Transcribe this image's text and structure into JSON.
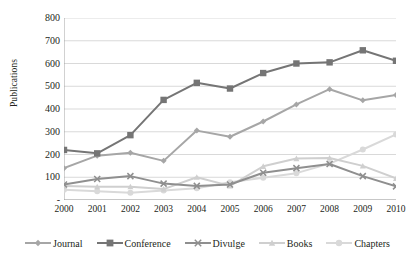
{
  "chart_data": {
    "type": "line",
    "title": "",
    "xlabel": "",
    "ylabel": "Publications",
    "x": [
      2000,
      2001,
      2002,
      2003,
      2004,
      2005,
      2006,
      2007,
      2008,
      2009,
      2010
    ],
    "categories": [
      "2000",
      "2001",
      "2002",
      "2003",
      "2004",
      "2005",
      "2006",
      "2007",
      "2008",
      "2009",
      "2010"
    ],
    "xlim": [
      2000,
      2010
    ],
    "ylim": [
      0,
      800
    ],
    "yticks": [
      0,
      100,
      200,
      300,
      400,
      500,
      600,
      700,
      800
    ],
    "ytick_labels": [
      "-",
      "100",
      "200",
      "300",
      "400",
      "500",
      "600",
      "700",
      "800"
    ],
    "grid": "horizontal",
    "legend_position": "bottom",
    "series": [
      {
        "name": "Journal",
        "marker": "diamond",
        "color": "#a6a6a6",
        "values": [
          140,
          195,
          208,
          172,
          305,
          278,
          345,
          420,
          487,
          438,
          462
        ]
      },
      {
        "name": "Conference",
        "marker": "square",
        "color": "#757575",
        "values": [
          220,
          205,
          285,
          440,
          515,
          490,
          558,
          600,
          605,
          658,
          612
        ]
      },
      {
        "name": "Divulge",
        "marker": "x",
        "color": "#8f8f8f",
        "values": [
          68,
          92,
          105,
          72,
          62,
          68,
          120,
          140,
          158,
          105,
          60
        ]
      },
      {
        "name": "Books",
        "marker": "triangle",
        "color": "#cfcfcf",
        "values": [
          62,
          58,
          58,
          48,
          100,
          62,
          148,
          182,
          185,
          150,
          95
        ]
      },
      {
        "name": "Chapters",
        "marker": "circle",
        "color": "#d9d9d9",
        "values": [
          45,
          38,
          32,
          42,
          52,
          78,
          98,
          118,
          160,
          222,
          288
        ]
      }
    ]
  }
}
